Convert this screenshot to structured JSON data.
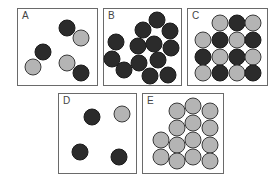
{
  "colors": {
    "dark": "#2b2b2b",
    "light": "#b4b4b4",
    "border": "#6a6a6a"
  },
  "boxes": [
    {
      "label": "A",
      "x": 17,
      "y": 8,
      "w": 81,
      "h": 78,
      "circles": [
        {
          "x": 67,
          "y": 28,
          "c": "dark"
        },
        {
          "x": 81,
          "y": 38,
          "c": "light"
        },
        {
          "x": 43,
          "y": 52,
          "c": "dark"
        },
        {
          "x": 33,
          "y": 67,
          "c": "light"
        },
        {
          "x": 67,
          "y": 63,
          "c": "light"
        },
        {
          "x": 81,
          "y": 73,
          "c": "dark"
        }
      ]
    },
    {
      "label": "B",
      "x": 103,
      "y": 8,
      "w": 79,
      "h": 78,
      "circles": [
        {
          "x": 157,
          "y": 20,
          "c": "dark"
        },
        {
          "x": 143,
          "y": 30,
          "c": "dark"
        },
        {
          "x": 170,
          "y": 31,
          "c": "dark"
        },
        {
          "x": 116,
          "y": 42,
          "c": "dark"
        },
        {
          "x": 138,
          "y": 46,
          "c": "dark"
        },
        {
          "x": 154,
          "y": 44,
          "c": "dark"
        },
        {
          "x": 171,
          "y": 48,
          "c": "dark"
        },
        {
          "x": 112,
          "y": 59,
          "c": "dark"
        },
        {
          "x": 139,
          "y": 63,
          "c": "dark"
        },
        {
          "x": 158,
          "y": 60,
          "c": "dark"
        },
        {
          "x": 124,
          "y": 70,
          "c": "dark"
        },
        {
          "x": 150,
          "y": 76,
          "c": "dark"
        },
        {
          "x": 168,
          "y": 75,
          "c": "dark"
        }
      ]
    },
    {
      "label": "C",
      "x": 187,
      "y": 8,
      "w": 81,
      "h": 78,
      "circles": [
        {
          "x": 220,
          "y": 23,
          "c": "light"
        },
        {
          "x": 237,
          "y": 23,
          "c": "dark"
        },
        {
          "x": 253,
          "y": 23,
          "c": "light"
        },
        {
          "x": 203,
          "y": 40,
          "c": "light"
        },
        {
          "x": 220,
          "y": 40,
          "c": "dark"
        },
        {
          "x": 237,
          "y": 40,
          "c": "light"
        },
        {
          "x": 253,
          "y": 40,
          "c": "dark"
        },
        {
          "x": 203,
          "y": 57,
          "c": "dark"
        },
        {
          "x": 220,
          "y": 57,
          "c": "light"
        },
        {
          "x": 237,
          "y": 57,
          "c": "dark"
        },
        {
          "x": 253,
          "y": 57,
          "c": "light"
        },
        {
          "x": 203,
          "y": 73,
          "c": "light"
        },
        {
          "x": 220,
          "y": 73,
          "c": "dark"
        },
        {
          "x": 237,
          "y": 73,
          "c": "light"
        },
        {
          "x": 253,
          "y": 73,
          "c": "dark"
        }
      ]
    },
    {
      "label": "D",
      "x": 58,
      "y": 93,
      "w": 79,
      "h": 81,
      "circles": [
        {
          "x": 92,
          "y": 117,
          "c": "dark"
        },
        {
          "x": 122,
          "y": 114,
          "c": "light"
        },
        {
          "x": 80,
          "y": 152,
          "c": "dark"
        },
        {
          "x": 119,
          "y": 157,
          "c": "dark"
        }
      ]
    },
    {
      "label": "E",
      "x": 142,
      "y": 93,
      "w": 82,
      "h": 81,
      "circles": [
        {
          "x": 177,
          "y": 111,
          "c": "light"
        },
        {
          "x": 193,
          "y": 106,
          "c": "light"
        },
        {
          "x": 210,
          "y": 111,
          "c": "light"
        },
        {
          "x": 177,
          "y": 128,
          "c": "light"
        },
        {
          "x": 193,
          "y": 123,
          "c": "light"
        },
        {
          "x": 210,
          "y": 128,
          "c": "light"
        },
        {
          "x": 161,
          "y": 140,
          "c": "light"
        },
        {
          "x": 177,
          "y": 145,
          "c": "light"
        },
        {
          "x": 193,
          "y": 140,
          "c": "light"
        },
        {
          "x": 210,
          "y": 145,
          "c": "light"
        },
        {
          "x": 161,
          "y": 157,
          "c": "light"
        },
        {
          "x": 177,
          "y": 161,
          "c": "light"
        },
        {
          "x": 193,
          "y": 157,
          "c": "light"
        },
        {
          "x": 210,
          "y": 161,
          "c": "light"
        }
      ]
    }
  ]
}
